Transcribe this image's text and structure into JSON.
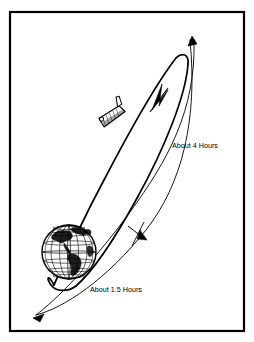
{
  "figure": {
    "kind": "orbital-transfer-diagram",
    "background_color": "#ffffff",
    "line_color": "#000000",
    "frame": {
      "name": "figure-border",
      "x": 10,
      "y": 12,
      "width": 234,
      "height": 319,
      "stroke_width": 2.2
    }
  },
  "labels": {
    "outer_orbit": "About 4 Hours",
    "inner_orbit": "About 1.5 Hours"
  },
  "elements": {
    "earth_globe": {
      "name": "earth-globe",
      "center_x": 69,
      "center_y": 252,
      "radius": 27
    },
    "spacecraft": {
      "name": "space-shuttle",
      "center_x": 112,
      "center_y": 115
    },
    "inner_orbit_ellipse": {
      "name": "inner-orbit-path",
      "apex_x": 178,
      "apex_y": 57
    },
    "outer_orbit_arc": {
      "name": "outer-orbit-path"
    },
    "arrow_inner": {
      "name": "inner-orbit-direction-arrow",
      "direction": "up-right"
    },
    "arrow_outer_top": {
      "name": "outer-orbit-top-arrow",
      "direction": "up"
    },
    "arrow_outer_bottom": {
      "name": "outer-orbit-bottom-arrow",
      "direction": "down-left"
    },
    "tick_mid": {
      "name": "orbit-midpoint-tick"
    }
  }
}
